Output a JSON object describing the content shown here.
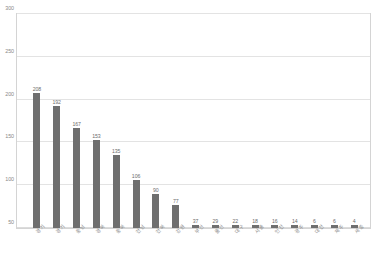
{
  "chart_data": {
    "type": "bar",
    "title": "",
    "subtitle": "",
    "xlabel": "",
    "ylabel": "",
    "ylim": [
      50,
      300
    ],
    "grid": true,
    "legend": "none",
    "orientation": "vertical",
    "bar_color": "#6f6f6f",
    "categories": [
      "경기",
      "경기",
      "충남",
      "경북",
      "충북",
      "전남",
      "전북",
      "강원",
      "부산",
      "울산",
      "대구",
      "서울",
      "인천",
      "광주",
      "대전",
      "제주",
      "세종"
    ],
    "values": [
      208,
      192,
      167,
      153,
      135,
      106,
      90,
      77,
      37,
      29,
      22,
      18,
      16,
      14,
      6,
      6,
      4
    ],
    "data_labels": [
      "208",
      "192",
      "167",
      "153",
      "135",
      "106",
      "90",
      "77",
      "37",
      "29",
      "22",
      "18",
      "16",
      "14",
      "6",
      "6",
      "4"
    ],
    "yticks": [
      50,
      100,
      150,
      200,
      250,
      300
    ],
    "ytick_labels": [
      "50",
      "100",
      "150",
      "200",
      "250",
      "300"
    ]
  },
  "colors": {
    "bar": "#6f6f6f",
    "grid": "#e3e3e3",
    "frame": "#d4d4d4",
    "tick_text": "#8a8a8a",
    "value_text": "#6d6d6d",
    "background": "#ffffff"
  }
}
